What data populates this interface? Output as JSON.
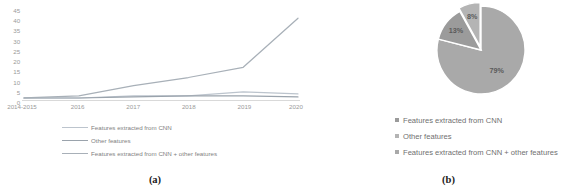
{
  "figure": {
    "panel_a_caption": "(a)",
    "panel_b_caption": "(b)"
  },
  "colors": {
    "series_cnn": "#b6bfc9",
    "series_other": "#9aa3ac",
    "series_both": "#a8b0b8",
    "pie_cnn_plus_other": "#a9a9a9",
    "pie_other": "#b4b4b4",
    "pie_cnn": "#9b9b9b",
    "axis": "#d9d9d9",
    "tick_text": "#9a9a9a",
    "legend_text": "#7f7f7f",
    "caption_text": "#1a1a1a"
  },
  "chart_data": [
    {
      "type": "line",
      "panel": "(a)",
      "title": "",
      "xlabel": "",
      "ylabel": "",
      "categories": [
        "2014-2015",
        "2016",
        "2017",
        "2018",
        "2019",
        "2020"
      ],
      "ylim": [
        0,
        45
      ],
      "yticks": [
        0,
        5,
        10,
        15,
        20,
        25,
        30,
        35,
        40,
        45
      ],
      "grid": false,
      "legend_position": "bottom",
      "series": [
        {
          "name": "Features extracted from CNN",
          "values": [
            1,
            1,
            2,
            2,
            4,
            3
          ]
        },
        {
          "name": "Other features",
          "values": [
            1,
            1,
            1.5,
            2,
            2,
            1.5
          ]
        },
        {
          "name": "Features extracted from CNN + other features",
          "values": [
            1,
            2,
            7,
            11,
            16,
            40
          ]
        }
      ]
    },
    {
      "type": "pie",
      "panel": "(b)",
      "title": "",
      "legend_position": "bottom",
      "labels": [
        "Features extracted from CNN",
        "Other features",
        "Features extracted from CNN + other features"
      ],
      "values": [
        13,
        8,
        79
      ],
      "value_labels": [
        "13%",
        "8%",
        "79%"
      ]
    }
  ]
}
